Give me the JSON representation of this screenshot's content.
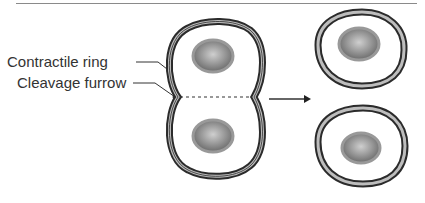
{
  "diagram": {
    "labels": {
      "contractile_ring": "Contractile ring",
      "cleavage_furrow": "Cleavage furrow"
    },
    "stages": [
      {
        "name": "dividing-cell",
        "description": "Single cell with two nuclei pinching at the cleavage furrow"
      },
      {
        "name": "daughter-cells",
        "description": "Two separate daughter cells, each with one nucleus"
      }
    ],
    "colors": {
      "membrane_dark": "#2b2b2b",
      "membrane_light": "#bdbdbd",
      "nucleus_center": "#c8c8c8",
      "nucleus_edge": "#6e6e6e",
      "text": "#333333",
      "rule": "#8a8a8a"
    }
  }
}
